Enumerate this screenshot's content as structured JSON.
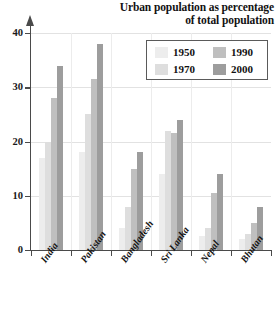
{
  "chart_data": {
    "type": "bar",
    "title": "Urban population as percentage of total population",
    "title_lines": [
      "Urban population as percentage",
      "of total population"
    ],
    "xlabel": "",
    "ylabel": "",
    "ylim": [
      0,
      40
    ],
    "yticks": [
      0,
      10,
      20,
      30,
      40
    ],
    "ytick_labels": [
      "0",
      "10",
      "20",
      "30",
      "40"
    ],
    "grid": true,
    "legend_position": "top-right",
    "categories": [
      "India",
      "Pakistan",
      "Bangladesh",
      "Sri Lanka",
      "Nepal",
      "Bhutan"
    ],
    "series": [
      {
        "name": "1950",
        "color": "#ededed",
        "values": [
          17,
          18,
          4,
          14,
          2.5,
          2
        ]
      },
      {
        "name": "1970",
        "color": "#dedede",
        "values": [
          20,
          25,
          8,
          22,
          4,
          3
        ]
      },
      {
        "name": "1990",
        "color": "#bfbfbf",
        "values": [
          28,
          31.5,
          15,
          21.5,
          10.5,
          5
        ]
      },
      {
        "name": "2000",
        "color": "#9d9d9d",
        "values": [
          34,
          38,
          18,
          24,
          14,
          8
        ]
      }
    ]
  },
  "legend": {
    "entries": [
      {
        "label": "1950"
      },
      {
        "label": "1990"
      },
      {
        "label": "1970"
      },
      {
        "label": "2000"
      }
    ]
  }
}
